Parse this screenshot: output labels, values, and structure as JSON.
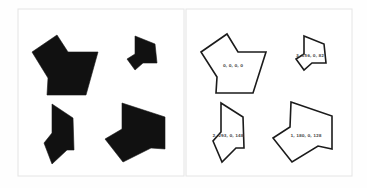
{
  "figure": {
    "panels": [
      {
        "name": "filled-panel",
        "frame": {
          "x": 18,
          "y": 9,
          "w": 166,
          "h": 167
        },
        "shapes": [
          {
            "name": "filled-shape-large",
            "points": "32,52 57,35 68,52 98,52 86,95 47,95 48,78"
          },
          {
            "name": "filled-shape-small",
            "points": "135,36 155,44 157,63 143,63 135,70 127,59 135,54"
          },
          {
            "name": "filled-shape-narrow",
            "points": "52,104 73,118 74,150 67,150 52,164 44,143 52,133"
          },
          {
            "name": "filled-shape-wide",
            "points": "122,103 165,117 165,149 151,148 123,162 105,139 122,129"
          }
        ]
      },
      {
        "name": "outline-panel",
        "frame": {
          "x": 186,
          "y": 9,
          "w": 166,
          "h": 167
        },
        "shapes": [
          {
            "name": "outline-shape-large",
            "points": "201,52 227,34 238,52 266,52 253,93 216,93 217,77",
            "label": "0, 0, 0, 0",
            "label_x": 233,
            "label_y": 67
          },
          {
            "name": "outline-shape-small",
            "points": "304,36 324,44 326,63 312,63 304,70 296,59 304,54",
            "label": "3, 156, 0, 82",
            "label_x": 310,
            "label_y": 57
          },
          {
            "name": "outline-shape-narrow",
            "points": "221,103 243,117 244,148 236,148 222,162 213,141 221,132",
            "label": "2, 293, 0, 148",
            "label_x": 228,
            "label_y": 137
          },
          {
            "name": "outline-shape-wide",
            "points": "291,102 332,116 332,149 318,146 292,162 273,138 290,127",
            "label": "1, 180, 0, 128",
            "label_x": 306,
            "label_y": 137
          }
        ]
      }
    ]
  }
}
